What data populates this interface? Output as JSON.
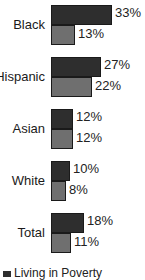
{
  "chart_data": {
    "type": "bar",
    "orientation": "horizontal",
    "title": "",
    "xlabel": "",
    "ylabel": "",
    "categories": [
      "Black",
      "Hispanic",
      "Asian",
      "White",
      "Total"
    ],
    "series": [
      {
        "name": "Living in Poverty",
        "color": "#2e2e2e",
        "values": [
          33,
          27,
          12,
          10,
          18
        ],
        "labels": [
          "33%",
          "27%",
          "12%",
          "10%",
          "18%"
        ]
      },
      {
        "name": "",
        "color": "#6f6f6f",
        "values": [
          13,
          22,
          12,
          8,
          11
        ],
        "labels": [
          "13%",
          "22%",
          "12%",
          "8%",
          "11%"
        ]
      }
    ],
    "xlim": [
      0,
      35
    ],
    "grid": false,
    "legend_position": "bottom-left",
    "legend": [
      "Living in Poverty"
    ]
  },
  "groups": [
    {
      "label": "Black",
      "v0": "33%",
      "v1": "13%"
    },
    {
      "label": "Hispanic",
      "v0": "27%",
      "v1": "22%"
    },
    {
      "label": "Asian",
      "v0": "12%",
      "v1": "12%"
    },
    {
      "label": "White",
      "v0": "10%",
      "v1": "8%"
    },
    {
      "label": "Total",
      "v0": "18%",
      "v1": "11%"
    }
  ],
  "legend": {
    "label": "Living in Poverty"
  }
}
